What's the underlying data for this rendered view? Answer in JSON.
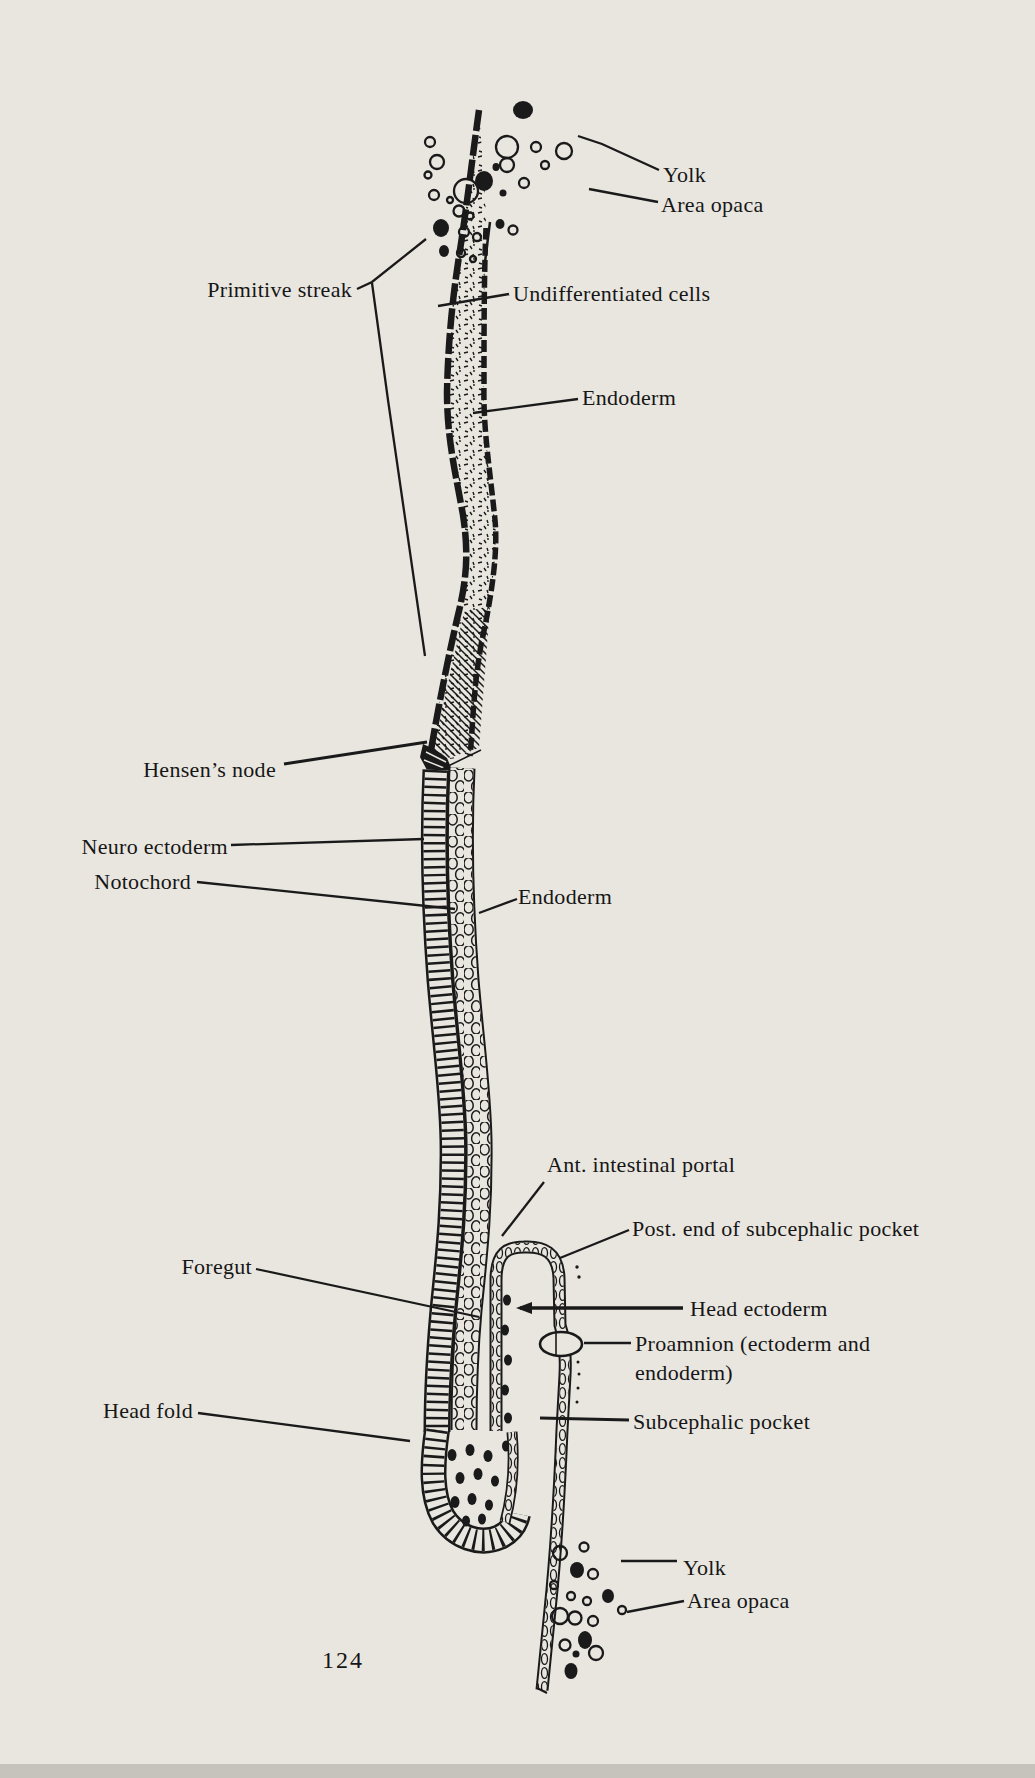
{
  "page": {
    "ink_color": "#1a1a1a",
    "paper_color": "#e9e6e0",
    "page_number": "124"
  },
  "figure": {
    "labels": {
      "yolk_top": "Yolk",
      "area_opaca_top": "Area opaca",
      "primitive_streak": "Primitive streak",
      "undifferentiated_cells": "Undifferentiated cells",
      "endoderm_upper": "Endoderm",
      "hensens_node": "Hensen’s node",
      "neuro_ectoderm": "Neuro ectoderm",
      "notochord": "Notochord",
      "endoderm_lower": "Endoderm",
      "ant_intestinal_portal": "Ant. intestinal portal",
      "post_end_subcephalic_pocket": "Post. end of subcephalic pocket",
      "foregut": "Foregut",
      "head_ectoderm": "Head ectoderm",
      "proamnion_line1": "Proamnion (ectoderm and",
      "proamnion_line2": "endoderm)",
      "head_fold": "Head fold",
      "subcephalic_pocket": "Subcephalic pocket",
      "yolk_bottom": "Yolk",
      "area_opaca_bottom": "Area opaca"
    }
  }
}
